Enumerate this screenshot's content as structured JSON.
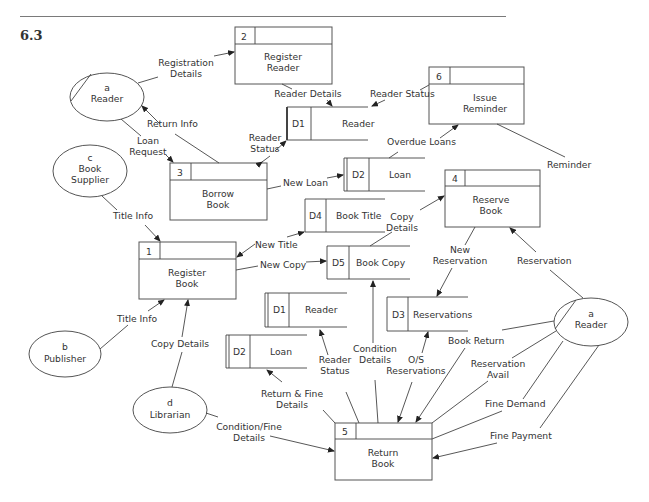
{
  "section_number": "6.3",
  "processes": [
    {
      "id": "2",
      "line1": "Register",
      "line2": "Reader"
    },
    {
      "id": "6",
      "line1": "Issue",
      "line2": "Reminder"
    },
    {
      "id": "3",
      "line1": "Borrow",
      "line2": "Book"
    },
    {
      "id": "4",
      "line1": "Reserve",
      "line2": "Book"
    },
    {
      "id": "1",
      "line1": "Register",
      "line2": "Book"
    },
    {
      "id": "5",
      "line1": "Return",
      "line2": "Book"
    }
  ],
  "data_stores": [
    {
      "id": "D1",
      "name": "Reader"
    },
    {
      "id": "D2",
      "name": "Loan"
    },
    {
      "id": "D4",
      "name": "Book Title"
    },
    {
      "id": "D5",
      "name": "Book Copy"
    },
    {
      "id": "D1",
      "name": "Reader"
    },
    {
      "id": "D3",
      "name": "Reservations"
    },
    {
      "id": "D2",
      "name": "Loan"
    }
  ],
  "entities": [
    {
      "id": "a",
      "name": "Reader"
    },
    {
      "id": "c",
      "name": "Book",
      "name2": "Supplier"
    },
    {
      "id": "b",
      "name": "Publisher"
    },
    {
      "id": "d",
      "name": "Librarian"
    },
    {
      "id": "a",
      "name": "Reader"
    }
  ],
  "flows": {
    "registration_details": [
      "Registration",
      "Details"
    ],
    "reader_details": "Reader Details",
    "reader_status_top": "Reader Status",
    "return_info": "Return Info",
    "loan_request": [
      "Loan",
      "Request"
    ],
    "reader_status_mid": [
      "Reader",
      "Status"
    ],
    "overdue_loans": "Overdue Loans",
    "reminder": "Reminder",
    "new_loan": "New Loan",
    "title_info_c": "Title Info",
    "new_title": "New Title",
    "new_copy": "New Copy",
    "copy_details_top": [
      "Copy",
      "Details"
    ],
    "new_reservation": [
      "New",
      "Reservation"
    ],
    "reservation": "Reservation",
    "title_info_b": "Title Info",
    "copy_details_d": "Copy Details",
    "reader_status_low": [
      "Reader",
      "Status"
    ],
    "condition_details": [
      "Condition",
      "Details"
    ],
    "os_reservations": [
      "O/S",
      "Reservations"
    ],
    "book_return": "Book Return",
    "reservation_avail": [
      "Reservation",
      "Avail"
    ],
    "return_fine_details": [
      "Return & Fine",
      "Details"
    ],
    "fine_demand": "Fine Demand",
    "condition_fine_details": [
      "Condition/Fine",
      "Details"
    ],
    "fine_payment": "Fine Payment"
  }
}
